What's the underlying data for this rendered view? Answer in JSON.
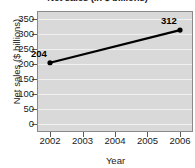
{
  "chart_data": {
    "type": "line",
    "title": "Net sales (in $ billions)",
    "xlabel": "Year",
    "ylabel": "Net sales ($ billions)",
    "x": [
      2002,
      2003,
      2004,
      2005,
      2006
    ],
    "xtick_labels": [
      "2002",
      "2003",
      "2004",
      "2005",
      "2006"
    ],
    "xlim": [
      2001.6,
      2006.4
    ],
    "ytick_labels": [
      "0",
      "50",
      "100",
      "150",
      "200",
      "250",
      "300",
      "350"
    ],
    "yticks": [
      0,
      50,
      100,
      150,
      200,
      250,
      300,
      350
    ],
    "ylim": [
      -25,
      375
    ],
    "grid": true,
    "legend": "none",
    "series": [
      {
        "name": "Net sales",
        "points": [
          {
            "x": 2002,
            "y": 204,
            "label": "204"
          },
          {
            "x": 2006,
            "y": 312,
            "label": "312"
          }
        ]
      }
    ],
    "annotations": [
      {
        "text": "204",
        "x": 2002,
        "y": 204,
        "position": "above-left"
      },
      {
        "text": "312",
        "x": 2006,
        "y": 312,
        "position": "above-left"
      }
    ],
    "colors": {
      "plot_background": "#d9d9d9",
      "gridline": "#f0f0f0",
      "axis": "#8a8a8a",
      "series_line": "#000000",
      "text": "#1a1a1a"
    }
  }
}
